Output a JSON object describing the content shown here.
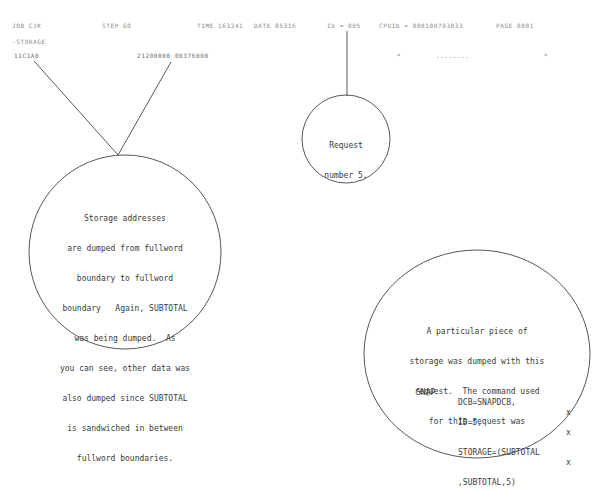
{
  "header": {
    "job": "JOB CJK",
    "step": "STEP GO",
    "time": "TIME 163241",
    "date": "DATE 85316",
    "id": "ID = 005",
    "cpuid": "CPUID = 000100793033",
    "page": "PAGE 0001"
  },
  "dump": {
    "section_label": "-STORAGE",
    "address": "11C1A0",
    "contents": "21200000 00376000",
    "char_left_marker": "*",
    "char_text": "........",
    "char_right_marker": "*"
  },
  "annotations": {
    "request_number": {
      "lines": [
        "Request",
        "number 5."
      ]
    },
    "storage_addresses": {
      "lines": [
        "Storage addresses",
        "are dumped from fullword",
        "boundary to fullword",
        "boundary   Again, SUBTOTAL",
        "was being dumped.  As",
        "you can see, other data was",
        "also dumped since SUBTOTAL",
        "is sandwiched in between",
        "fullword boundaries."
      ]
    },
    "snap_command": {
      "lines": [
        "A particular piece of",
        "storage was dumped with this",
        "request.  The command used",
        "for this request was"
      ],
      "code": {
        "macro": "SNAP",
        "operands": [
          {
            "text": "DCB=SNAPDCB,",
            "continuation": "x"
          },
          {
            "text": "ID=5,",
            "continuation": "x"
          },
          {
            "text": "STORAGE=(SUBTOTAL",
            "continuation": "x"
          },
          {
            "text": ",SUBTOTAL,5)",
            "continuation": ""
          }
        ]
      }
    }
  }
}
